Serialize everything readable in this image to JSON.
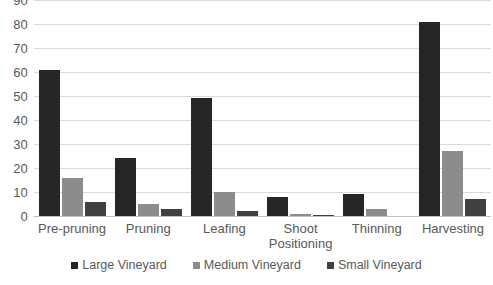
{
  "chart_data": {
    "type": "bar",
    "title": "",
    "subtitle": "",
    "xlabel": "",
    "ylabel": "",
    "ylim": [
      0,
      90
    ],
    "ytick_step": 10,
    "yticks": [
      90,
      80,
      70,
      60,
      50,
      40,
      30,
      20,
      10,
      0
    ],
    "grid": true,
    "grid_axis": "y",
    "legend_position": "bottom",
    "categories": [
      "Pre-pruning",
      "Pruning",
      "Leafing",
      "Shoot\nPositioning",
      "Thinning",
      "Harvesting"
    ],
    "series": [
      {
        "name": "Large Vineyard",
        "color": "#262626",
        "values": [
          61,
          24,
          49,
          8,
          9,
          81
        ]
      },
      {
        "name": "Medium Vineyard",
        "color": "#8c8c8c",
        "values": [
          16,
          5,
          10,
          1,
          3,
          27
        ]
      },
      {
        "name": "Small Vineyard",
        "color": "#404040",
        "values": [
          6,
          3,
          2,
          0.5,
          0,
          7
        ]
      }
    ]
  },
  "colors": {
    "background": "#ffffff",
    "gridline": "#d9d9d9",
    "baseline": "#bfbfbf",
    "text": "#595959",
    "large_vineyard": "#262626",
    "medium_vineyard": "#8c8c8c",
    "small_vineyard": "#404040"
  }
}
